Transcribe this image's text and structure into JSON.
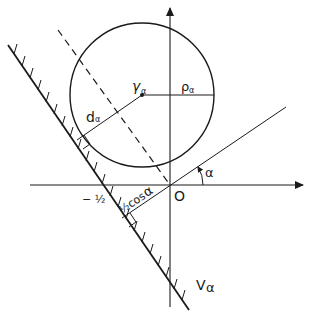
{
  "diagram": {
    "labels": {
      "center": "γ",
      "center_sub": "α",
      "radius": "ρ",
      "radius_sub": "α",
      "distance": "d",
      "distance_sub": "α",
      "minus_half": "− ½",
      "half_cos": "½cos",
      "half_cos_alpha": "α",
      "origin": "O",
      "angle": "α",
      "region": "V",
      "region_sub": "α"
    },
    "colors": {
      "stroke": "#1a1a1a",
      "background": "#ffffff"
    }
  }
}
